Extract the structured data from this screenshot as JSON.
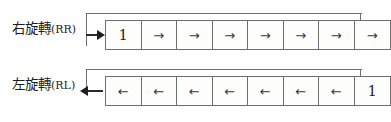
{
  "figure": {
    "background_color": "#ffffff",
    "stroke_color": "#6e6e6e",
    "arrow_color": "#1f1f1f",
    "text_color": "#1d1d1d"
  },
  "diagrams": [
    {
      "id": "rotate-right",
      "label_cjk": "右旋轉",
      "label_paren": "(RR)",
      "label_full": "右旋轉(RR)",
      "cell_count": 8,
      "cells": [
        "1",
        "→",
        "→",
        "→",
        "→",
        "→",
        "→",
        "→"
      ],
      "feedback": {
        "from": "right",
        "to": "left",
        "path": "out-right-up-across-down-in-left",
        "input_arrow": "right",
        "output_arrow": "right"
      }
    },
    {
      "id": "rotate-left",
      "label_cjk": "左旋轉",
      "label_paren": "(RL)",
      "label_full": "左旋轉(RL)",
      "cell_count": 8,
      "cells": [
        "←",
        "←",
        "←",
        "←",
        "←",
        "←",
        "←",
        "1"
      ],
      "feedback": {
        "from": "left",
        "to": "right",
        "path": "out-left-up-across-down-in-right",
        "input_arrow": "left",
        "output_arrow": "left"
      }
    }
  ]
}
